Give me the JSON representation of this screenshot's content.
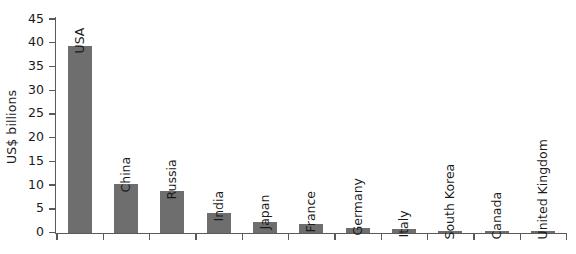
{
  "chart_data": {
    "type": "bar",
    "title": "",
    "xlabel": "",
    "ylabel": "US$ billions",
    "ylim": [
      0,
      45
    ],
    "yticks": [
      0,
      5,
      10,
      15,
      20,
      25,
      30,
      35,
      40,
      45
    ],
    "grid": false,
    "legend": null,
    "bar_color": "#6e6e6e",
    "axis_color": "#5a5a5a",
    "categories": [
      "USA",
      "China",
      "Russia",
      "India",
      "Japan",
      "France",
      "Germany",
      "Italy",
      "South Korea",
      "Canada",
      "United Kingdom"
    ],
    "values": [
      39.5,
      10.3,
      8.8,
      4.2,
      2.4,
      1.9,
      1.1,
      0.8,
      0.3,
      0.25,
      0.3
    ],
    "series": [
      {
        "name": "US$ billions",
        "values": [
          39.5,
          10.3,
          8.8,
          4.2,
          2.4,
          1.9,
          1.1,
          0.8,
          0.3,
          0.25,
          0.3
        ]
      }
    ]
  }
}
